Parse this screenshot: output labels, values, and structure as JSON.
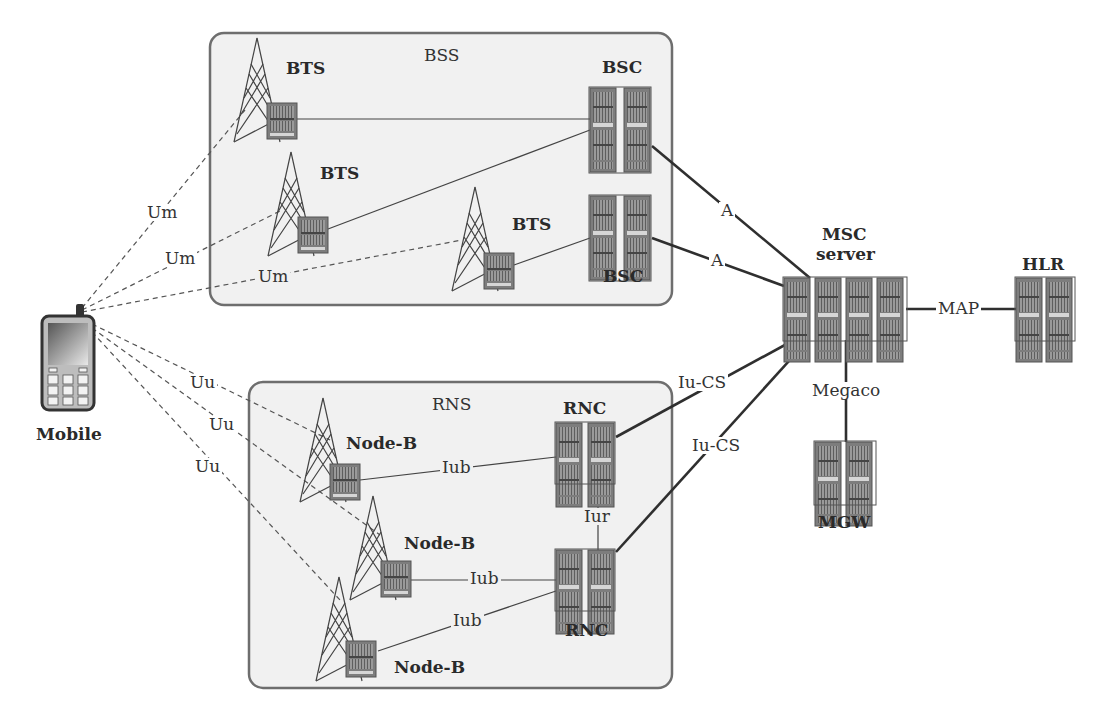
{
  "diagram": {
    "groups": {
      "bss": {
        "label": "BSS"
      },
      "rns": {
        "label": "RNS"
      }
    },
    "nodes": {
      "mobile": {
        "label": "Mobile",
        "icon": "mobile-phone-icon"
      },
      "bts1": {
        "label": "BTS",
        "icon": "cell-tower-icon"
      },
      "bts2": {
        "label": "BTS",
        "icon": "cell-tower-icon"
      },
      "bts3": {
        "label": "BTS",
        "icon": "cell-tower-icon"
      },
      "bsc1": {
        "label": "BSC",
        "icon": "server-rack-icon"
      },
      "bsc2": {
        "label": "BSC",
        "icon": "server-rack-icon"
      },
      "msc": {
        "label_line1": "MSC",
        "label_line2": "server",
        "icon": "server-rack-icon"
      },
      "hlr": {
        "label": "HLR",
        "icon": "server-rack-icon"
      },
      "mgw": {
        "label": "MGW",
        "icon": "server-rack-icon"
      },
      "rnc1": {
        "label": "RNC",
        "icon": "server-rack-icon"
      },
      "rnc2": {
        "label": "RNC",
        "icon": "server-rack-icon"
      },
      "nodeb1": {
        "label": "Node-B",
        "icon": "cell-tower-icon"
      },
      "nodeb2": {
        "label": "Node-B",
        "icon": "cell-tower-icon"
      },
      "nodeb3": {
        "label": "Node-B",
        "icon": "cell-tower-icon"
      }
    },
    "interfaces": {
      "um1": "Um",
      "um2": "Um",
      "um3": "Um",
      "uu1": "Uu",
      "uu2": "Uu",
      "uu3": "Uu",
      "a1": "A",
      "a2": "A",
      "map": "MAP",
      "megaco": "Megaco",
      "iucs1": "Iu-CS",
      "iucs2": "Iu-CS",
      "iub1": "Iub",
      "iub2": "Iub",
      "iub3": "Iub",
      "iur": "Iur"
    },
    "colors": {
      "group_fill": "#f1f1f1",
      "group_stroke": "#6e6e6e",
      "rack_fill": "#8a8a8a",
      "line": "#333333"
    }
  }
}
